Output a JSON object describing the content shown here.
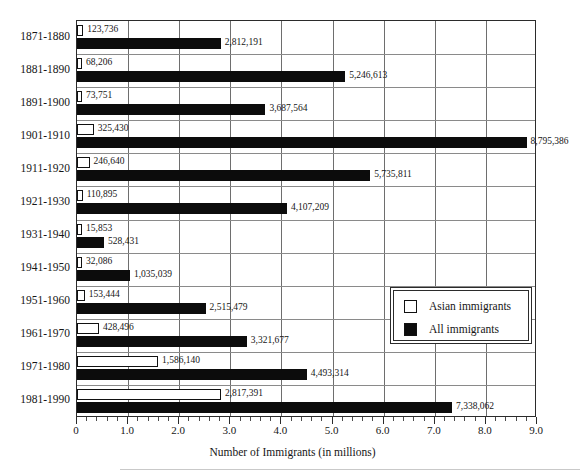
{
  "chart_data": {
    "type": "bar",
    "orientation": "horizontal",
    "title": "",
    "xlabel": "Number of Immigrants (in millions)",
    "ylabel": "",
    "xlim": [
      0,
      9
    ],
    "xunit": "millions",
    "grid": "both",
    "legend_position": "middle-right",
    "xticks": [
      "0",
      "1.0",
      "2.0",
      "3.0",
      "4.0",
      "5.0",
      "6.0",
      "7.0",
      "8.0",
      "9.0"
    ],
    "xtick_values": [
      0,
      1,
      2,
      3,
      4,
      5,
      6,
      7,
      8,
      9
    ],
    "minor_ticks_per_interval": 5,
    "categories": [
      "1871-1880",
      "1881-1890",
      "1891-1900",
      "1901-1910",
      "1911-1920",
      "1921-1930",
      "1931-1940",
      "1941-1950",
      "1951-1960",
      "1961-1970",
      "1971-1980",
      "1981-1990"
    ],
    "series": [
      {
        "name": "Asian immigrants",
        "fill": "dotted",
        "color": "#ffffff",
        "values": [
          123736,
          68206,
          73751,
          325430,
          246640,
          110895,
          15853,
          32086,
          153444,
          428496,
          1586140,
          2817391
        ],
        "labels": [
          "123,736",
          "68,206",
          "73,751",
          "325,430",
          "246,640",
          "110,895",
          "15,853",
          "32,086",
          "153,444",
          "428,496",
          "1,586,140",
          "2,817,391"
        ]
      },
      {
        "name": "All immigrants",
        "fill": "solid",
        "color": "#0c0c0c",
        "values": [
          2812191,
          5246613,
          3687564,
          8795386,
          5735811,
          4107209,
          528431,
          1035039,
          2515479,
          3321677,
          4493314,
          7338062
        ],
        "labels": [
          "2,812,191",
          "5,246,613",
          "3,687,564",
          "8,795,386",
          "5,735,811",
          "4,107,209",
          "528,431",
          "1,035,039",
          "2,515,479",
          "3,321,677",
          "4,493,314",
          "7,338,062"
        ]
      }
    ]
  },
  "legend": {
    "items": [
      {
        "label": "Asian immigrants"
      },
      {
        "label": "All immigrants"
      }
    ]
  }
}
